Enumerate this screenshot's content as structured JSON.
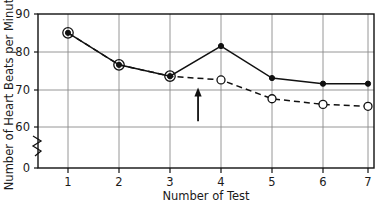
{
  "chart_data": {
    "type": "line",
    "title": "",
    "xlabel": "Number of Test",
    "ylabel": "Number of Heart Beats per Minute",
    "categories": [
      "1",
      "2",
      "3",
      "4",
      "5",
      "6",
      "7"
    ],
    "x": [
      1,
      2,
      3,
      4,
      5,
      6,
      7
    ],
    "xlim": [
      0.5,
      7.5
    ],
    "ylim": [
      60,
      90
    ],
    "y_axis_break": true,
    "y_break_note": "axis broken between 0 and 60",
    "grid": true,
    "legend_position": "none",
    "xticks": [
      "1",
      "2",
      "3",
      "4",
      "5",
      "6",
      "7"
    ],
    "yticks": [
      "0",
      "60",
      "70",
      "80",
      "90"
    ],
    "series": [
      {
        "name": "solid-line-series",
        "marker": "filled-circle",
        "linestyle": "solid",
        "color": "#111111",
        "values": [
          85,
          76.5,
          73.5,
          81.5,
          73,
          71.5,
          71.5
        ]
      },
      {
        "name": "dashed-line-series",
        "marker": "open-circle",
        "linestyle": "dashed",
        "color": "#111111",
        "values": [
          85,
          76.5,
          73.5,
          72.5,
          67.5,
          66,
          65.5
        ]
      }
    ],
    "annotations": [
      {
        "name": "up-arrow",
        "type": "arrow",
        "direction": "up",
        "x": 3.55,
        "y_start": 61.5,
        "y_end": 70.5,
        "text": ""
      }
    ]
  },
  "axes": {
    "x_title": "Number of Test",
    "y_title": "Number of Heart Beats per Minute",
    "x_tick_labels": [
      "1",
      "2",
      "3",
      "4",
      "5",
      "6",
      "7"
    ],
    "y_tick_labels": [
      "90",
      "80",
      "70",
      "60",
      "0"
    ]
  }
}
